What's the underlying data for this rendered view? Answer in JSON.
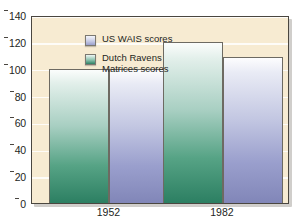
{
  "chart_data": {
    "type": "bar",
    "title": "",
    "xlabel": "",
    "ylabel": "",
    "categories": [
      "1952",
      "1982"
    ],
    "series": [
      {
        "name": "Dutch Ravens\nMatrices scores",
        "values": [
          100,
          120
        ],
        "color": "#2c7f62"
      },
      {
        "name": "US WAIS scores",
        "values": [
          100,
          109
        ],
        "color": "#8186b8"
      }
    ],
    "ylim": [
      0,
      140
    ],
    "yticks": [
      0,
      20,
      40,
      60,
      80,
      100,
      120,
      140
    ],
    "ytick_labels": [
      "0",
      "20",
      "40",
      "60",
      "80",
      "100",
      "120",
      "140"
    ],
    "grid": true,
    "legend_position": "top-left",
    "plot_background": "#f7ebd2",
    "frame_color": "#4a4640"
  },
  "legend": {
    "items": [
      {
        "label": "US WAIS scores",
        "swatch": "blue"
      },
      {
        "label": "Dutch Ravens\nMatrices scores",
        "swatch": "green"
      }
    ]
  }
}
